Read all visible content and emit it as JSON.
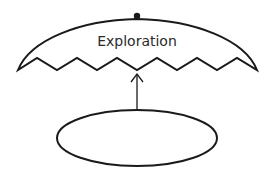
{
  "diagram": {
    "top_shape": {
      "label": "Exploration",
      "shape": "dome with zigzag bottom edge",
      "has_top_dot": true
    },
    "connector": {
      "type": "arrow",
      "direction": "up",
      "from": "bottom_ellipse",
      "to": "top_shape"
    },
    "bottom_shape": {
      "label": "",
      "shape": "ellipse"
    },
    "colors": {
      "stroke": "#1a1a1a",
      "background": "#ffffff",
      "text": "#2a2a2a"
    }
  }
}
